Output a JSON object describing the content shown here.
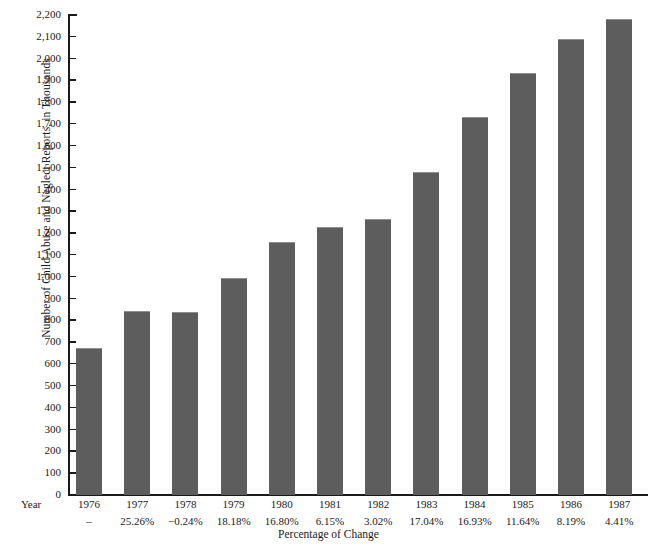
{
  "chart_data": {
    "type": "bar",
    "title": "",
    "subtitle": "",
    "xlabel": "Percentage of Change",
    "ylabel": "Number of Child Abuse and Neglect Reports, in Thousands",
    "categories": [
      "1976",
      "1977",
      "1978",
      "1979",
      "1980",
      "1981",
      "1982",
      "1983",
      "1984",
      "1985",
      "1986",
      "1987"
    ],
    "values": [
      669,
      838,
      836,
      988,
      1154,
      1225,
      1262,
      1477,
      1727,
      1928,
      2086,
      2178
    ],
    "annotations": [
      "–",
      "25.26%",
      "−0.24%",
      "18.18%",
      "16.80%",
      "6.15%",
      "3.02%",
      "17.04%",
      "16.93%",
      "11.64%",
      "8.19%",
      "4.41%"
    ],
    "annotation_row_label": "Year",
    "ylim": [
      0,
      2200
    ],
    "ytick_values": [
      0,
      100,
      200,
      300,
      400,
      500,
      600,
      700,
      800,
      900,
      1000,
      1100,
      1200,
      1300,
      1400,
      1500,
      1600,
      1700,
      1800,
      1900,
      2000,
      2100,
      2200
    ],
    "ytick_labels": [
      "0",
      "100",
      "200",
      "300",
      "400",
      "500",
      "600",
      "700",
      "800",
      "900",
      "1,000",
      "1,100",
      "1,200",
      "1,300",
      "1,400",
      "1,500",
      "1,600",
      "1,700",
      "1,800",
      "1,900",
      "2,000",
      "2,100",
      "2,200"
    ],
    "grid": false,
    "legend": "none",
    "bar_color": "#5d5d5d",
    "axis_color": "#1a1a1a",
    "background_color": "#ffffff"
  }
}
